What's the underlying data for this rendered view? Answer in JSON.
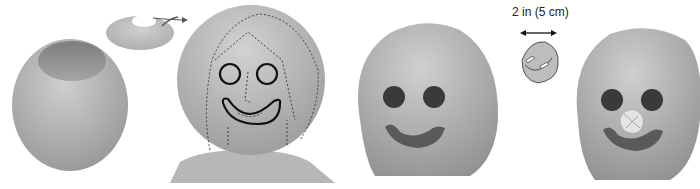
{
  "figure": {
    "panels": [
      {
        "id": "step-1",
        "content": "Hollow egg-shaped head with top cap removed (cap shown with arrow)"
      },
      {
        "id": "step-2",
        "content": "Head on bust with face outline traced: eyes and smile in bold, dashed hair and nose guides"
      },
      {
        "id": "step-3",
        "content": "Head with dark eyes and carved smile"
      },
      {
        "id": "step-4",
        "content": "Head with patched nose; inset patch diagram"
      }
    ],
    "dimension_label": "2 in (5 cm)",
    "colors": {
      "head_light": "#c9c9c9",
      "head_dark": "#8f8f8f",
      "eye": "#3a3a3a",
      "outline": "#111111",
      "bust": "#b5b5b5",
      "background": "#ffffff"
    }
  }
}
